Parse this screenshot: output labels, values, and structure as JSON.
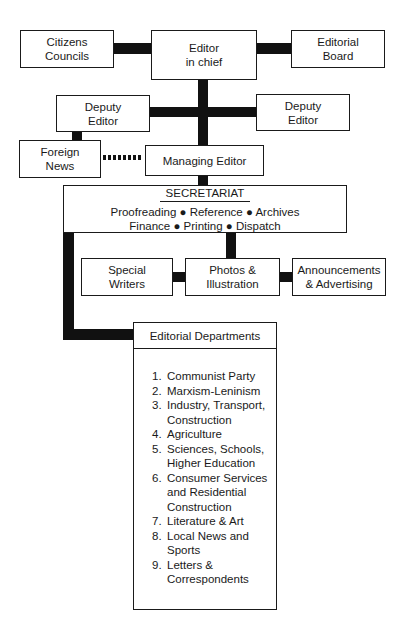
{
  "diagram": {
    "top_row": {
      "citizens_councils": [
        "Citizens",
        "Councils"
      ],
      "editor_in_chief": [
        "Editor",
        "in chief"
      ],
      "editorial_board": [
        "Editorial",
        "Board"
      ]
    },
    "deputy_left": [
      "Deputy",
      "Editor"
    ],
    "deputy_right": [
      "Deputy",
      "Editor"
    ],
    "foreign_news": [
      "Foreign",
      "News"
    ],
    "managing_editor": "Managing Editor",
    "secretariat": {
      "title": "SECRETARIAT",
      "line1": "Proofreading ● Reference ● Archives",
      "line2": "Finance ● Printing ● Dispatch"
    },
    "special_writers": [
      "Special",
      "Writers"
    ],
    "photos": [
      "Photos &",
      "Illustration"
    ],
    "announcements": [
      "Announcements",
      "& Advertising"
    ],
    "editorial_departments": {
      "title": "Editorial Departments",
      "items": [
        {
          "num": "1.",
          "lines": [
            "Communist Party"
          ]
        },
        {
          "num": "2.",
          "lines": [
            "Marxism-Leninism"
          ]
        },
        {
          "num": "3.",
          "lines": [
            "Industry, Transport,",
            "Construction"
          ]
        },
        {
          "num": "4.",
          "lines": [
            "Agriculture"
          ]
        },
        {
          "num": "5.",
          "lines": [
            "Sciences, Schools,",
            "Higher Education"
          ]
        },
        {
          "num": "6.",
          "lines": [
            "Consumer Services",
            "and Residential",
            "Construction"
          ]
        },
        {
          "num": "7.",
          "lines": [
            "Literature & Art"
          ]
        },
        {
          "num": "8.",
          "lines": [
            "Local News and",
            "Sports"
          ]
        },
        {
          "num": "9.",
          "lines": [
            "Letters &",
            "Correspondents"
          ]
        }
      ]
    }
  }
}
